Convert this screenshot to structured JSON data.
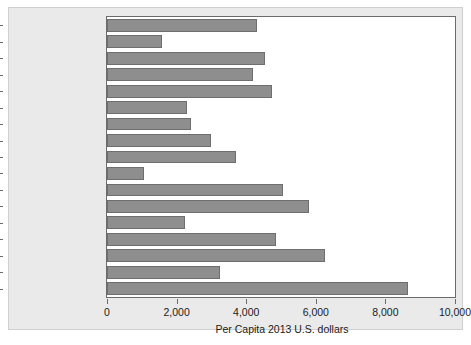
{
  "chart_data": {
    "type": "bar",
    "orientation": "horizontal",
    "title": "",
    "xlabel": "Per Capita 2013 U.S. dollars",
    "ylabel": "",
    "xlim": [
      0,
      10000
    ],
    "xticks": [
      0,
      2000,
      4000,
      6000,
      8000,
      10000
    ],
    "xticklabels": [
      "0",
      "2,000",
      "4,000",
      "6,000",
      "8,000",
      "10,000"
    ],
    "grid": false,
    "legend": false,
    "bar_color": "#8e8e8e",
    "bar_edge_color": "#6e6e6e",
    "plot_background": "#ffffff",
    "figure_background": "#eaeaea",
    "categories": [
      "Canada",
      "Chile",
      "Denmark",
      "France",
      "Germany",
      "Greece",
      "Israel",
      "Italy",
      "Japan",
      "Mexico",
      "Netherlands",
      "Norway",
      "South Korea",
      "Sweden",
      "Switzerland",
      "United Kingdom",
      "United States"
    ],
    "values": [
      4300,
      1570,
      4550,
      4200,
      4750,
      2300,
      2400,
      3000,
      3700,
      1050,
      5050,
      5800,
      2250,
      4850,
      6250,
      3250,
      8650
    ]
  }
}
